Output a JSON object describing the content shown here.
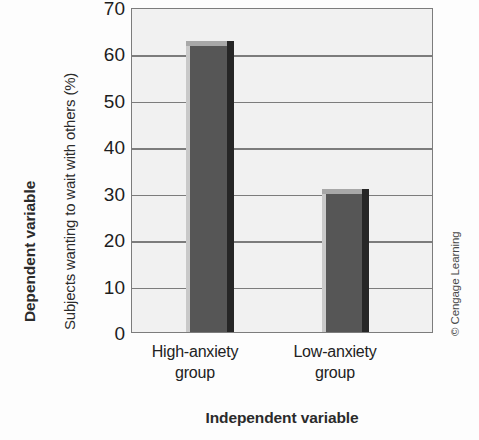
{
  "chart_data": {
    "type": "bar",
    "title": "",
    "categories": [
      "High-anxiety group",
      "Low-anxiety group"
    ],
    "values": [
      63,
      31
    ],
    "xlabel": "Independent variable",
    "ylabel": "Subjects wanting to wait with others (%)",
    "ylim": [
      0,
      70
    ],
    "ytick_labels": [
      "0",
      "10",
      "20",
      "30",
      "40",
      "50",
      "60",
      "70"
    ],
    "ytick_values": [
      0,
      10,
      20,
      30,
      40,
      50,
      60,
      70
    ],
    "grid": true,
    "legend": "none",
    "series": [
      {
        "name": "Subjects wanting to wait with others (%)",
        "values": [
          63,
          31
        ],
        "color": "#565656"
      }
    ],
    "bar_colors": {
      "face": "#565656",
      "top": "#a8a8a8",
      "left": "#c9c9c9",
      "right": "#262626"
    },
    "plot_background": "#f1f1f1",
    "gridline_color": "#7c7c7c",
    "axis_border_color": "#7c7c7c"
  },
  "labels": {
    "dependent_variable": "Dependent variable",
    "independent_variable": "Independent variable",
    "y_axis_title": "Subjects wanting to wait with others (%)",
    "category_1_line_1": "High-anxiety",
    "category_1_line_2": "group",
    "category_2_line_1": "Low-anxiety",
    "category_2_line_2": "group"
  },
  "credit": {
    "text": "© Cengage Learning"
  }
}
